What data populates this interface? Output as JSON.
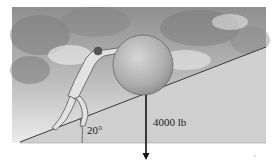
{
  "figure": {
    "incline_angle_label": "20°",
    "weight_label": "4000 lb",
    "corner_mark": "'",
    "colors": {
      "sky_dark": "#8a8a8a",
      "sky_light": "#e6e6e6",
      "ramp_fill": "#cfcfcf",
      "ramp_edge": "#3a3a3a",
      "boulder": "#b5b5b5",
      "arrow": "#111111"
    }
  }
}
